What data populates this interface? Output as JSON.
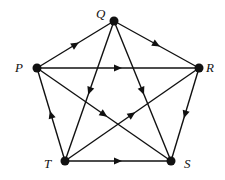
{
  "diagram": {
    "type": "directed-graph",
    "colors": {
      "stroke": "#111111",
      "background": "#ffffff"
    },
    "nodes": [
      {
        "id": "Q",
        "label": "Q",
        "x": 114,
        "y": 21,
        "label_x": 96,
        "label_y": 18
      },
      {
        "id": "P",
        "label": "P",
        "x": 37,
        "y": 68,
        "label_x": 15,
        "label_y": 72
      },
      {
        "id": "R",
        "label": "R",
        "x": 199,
        "y": 68,
        "label_x": 206,
        "label_y": 72
      },
      {
        "id": "T",
        "label": "T",
        "x": 65,
        "y": 161,
        "label_x": 44,
        "label_y": 168
      },
      {
        "id": "S",
        "label": "S",
        "x": 171,
        "y": 161,
        "label_x": 184,
        "label_y": 168
      }
    ],
    "edges": [
      {
        "from": "P",
        "to": "Q"
      },
      {
        "from": "Q",
        "to": "R"
      },
      {
        "from": "P",
        "to": "R"
      },
      {
        "from": "Q",
        "to": "T"
      },
      {
        "from": "Q",
        "to": "S"
      },
      {
        "from": "P",
        "to": "S"
      },
      {
        "from": "T",
        "to": "R"
      },
      {
        "from": "R",
        "to": "S"
      },
      {
        "from": "T",
        "to": "P"
      },
      {
        "from": "T",
        "to": "S"
      }
    ]
  }
}
